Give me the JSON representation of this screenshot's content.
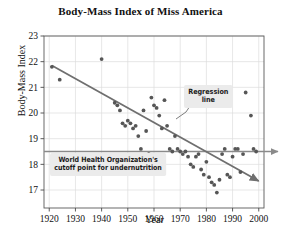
{
  "chart_data": {
    "type": "scatter",
    "title": "Body-Mass Index of Miss America",
    "xlabel": "Year",
    "ylabel": "Body-Mass Index",
    "xlim": [
      1918,
      2002
    ],
    "ylim": [
      16.3,
      23
    ],
    "xticks": [
      1920,
      1930,
      1940,
      1950,
      1960,
      1970,
      1980,
      1990,
      2000
    ],
    "yticks": [
      17,
      18,
      19,
      20,
      21,
      22,
      23
    ],
    "grid": true,
    "legend": "none",
    "series": [
      {
        "name": "Miss America BMI",
        "points": [
          [
            1921,
            21.8
          ],
          [
            1924,
            21.3
          ],
          [
            1940,
            22.1
          ],
          [
            1945,
            20.4
          ],
          [
            1946,
            20.3
          ],
          [
            1947,
            20.1
          ],
          [
            1948,
            19.6
          ],
          [
            1949,
            19.5
          ],
          [
            1950,
            19.7
          ],
          [
            1951,
            19.6
          ],
          [
            1952,
            19.4
          ],
          [
            1953,
            19.5
          ],
          [
            1954,
            19.1
          ],
          [
            1955,
            18.6
          ],
          [
            1956,
            20.1
          ],
          [
            1957,
            19.3
          ],
          [
            1958,
            18.4
          ],
          [
            1959,
            20.6
          ],
          [
            1960,
            20.3
          ],
          [
            1961,
            20.2
          ],
          [
            1962,
            19.9
          ],
          [
            1963,
            19.4
          ],
          [
            1964,
            20.5
          ],
          [
            1965,
            19.5
          ],
          [
            1966,
            18.6
          ],
          [
            1967,
            18.5
          ],
          [
            1968,
            19.1
          ],
          [
            1969,
            18.6
          ],
          [
            1970,
            18.5
          ],
          [
            1971,
            18.4
          ],
          [
            1972,
            18.5
          ],
          [
            1973,
            18.3
          ],
          [
            1974,
            18.0
          ],
          [
            1975,
            17.9
          ],
          [
            1976,
            18.3
          ],
          [
            1977,
            18.4
          ],
          [
            1978,
            17.8
          ],
          [
            1979,
            17.6
          ],
          [
            1980,
            18.1
          ],
          [
            1981,
            17.5
          ],
          [
            1982,
            17.3
          ],
          [
            1983,
            17.2
          ],
          [
            1984,
            16.9
          ],
          [
            1985,
            17.4
          ],
          [
            1986,
            18.4
          ],
          [
            1987,
            18.6
          ],
          [
            1988,
            17.6
          ],
          [
            1989,
            17.5
          ],
          [
            1990,
            18.3
          ],
          [
            1991,
            18.6
          ],
          [
            1992,
            18.6
          ],
          [
            1993,
            17.7
          ],
          [
            1994,
            18.4
          ],
          [
            1995,
            20.8
          ],
          [
            1997,
            19.9
          ],
          [
            1998,
            18.6
          ],
          [
            1999,
            18.5
          ]
        ]
      }
    ],
    "regression_line": {
      "label": "Regression line",
      "x_start": 1921,
      "y_start": 21.85,
      "x_end": 2000,
      "y_end": 17.35
    },
    "reference_line": {
      "label": "World Health Organization's cutoff point for undernutrition",
      "y": 18.5,
      "orientation": "horizontal"
    }
  },
  "annotations": {
    "who_line1": "World Health Organization's",
    "who_line2": "cutoff point for undernutrition",
    "regression_line1": "Regression",
    "regression_line2": "line"
  },
  "colors": {
    "point": "#565656",
    "regression": "#6f6f6f",
    "reference": "#8a8a8a",
    "grid": "#dcdcdc",
    "axis": "#4a4a4a",
    "annotation_bg": "#ebebeb",
    "text": "#111111"
  }
}
